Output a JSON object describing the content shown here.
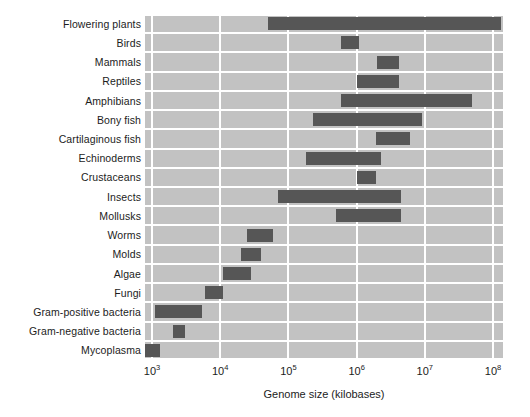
{
  "chart_data": {
    "type": "bar",
    "orientation": "horizontal",
    "subtype": "range-bar",
    "title": "",
    "xlabel": "Genome size (kilobases)",
    "ylabel": "",
    "xscale": "log",
    "xlim": [
      1000,
      200000000
    ],
    "grid": true,
    "legend": false,
    "plot_background": "#c2c2c2",
    "bar_color": "#565656",
    "gridline_color": "#ffffff",
    "xticks": [
      1000,
      10000,
      100000,
      1000000,
      10000000,
      100000000
    ],
    "xticklabels": [
      "10³",
      "10⁴",
      "10⁵",
      "10⁶",
      "10⁷",
      "10⁸"
    ],
    "xtick_mantissas": [
      "10",
      "10",
      "10",
      "10",
      "10",
      "10"
    ],
    "xtick_exponents": [
      "3",
      "4",
      "5",
      "6",
      "7",
      "8"
    ],
    "categories": [
      "Flowering plants",
      "Birds",
      "Mammals",
      "Reptiles",
      "Amphibians",
      "Bony fish",
      "Cartilaginous fish",
      "Echinoderms",
      "Crustaceans",
      "Insects",
      "Mollusks",
      "Worms",
      "Molds",
      "Algae",
      "Fungi",
      "Gram-positive bacteria",
      "Gram-negative bacteria",
      "Mycoplasma"
    ],
    "ranges": [
      {
        "category": "Flowering plants",
        "low": 50000,
        "high": 130000000
      },
      {
        "category": "Birds",
        "low": 600000,
        "high": 1100000
      },
      {
        "category": "Mammals",
        "low": 2000000,
        "high": 4200000
      },
      {
        "category": "Reptiles",
        "low": 1000000,
        "high": 4200000
      },
      {
        "category": "Amphibians",
        "low": 600000,
        "high": 50000000
      },
      {
        "category": "Bony fish",
        "low": 230000,
        "high": 9000000
      },
      {
        "category": "Cartilaginous fish",
        "low": 1900000,
        "high": 6000000
      },
      {
        "category": "Echinoderms",
        "low": 180000,
        "high": 2300000
      },
      {
        "category": "Crustaceans",
        "low": 1000000,
        "high": 1900000
      },
      {
        "category": "Insects",
        "low": 70000,
        "high": 4500000
      },
      {
        "category": "Mollusks",
        "low": 500000,
        "high": 4500000
      },
      {
        "category": "Worms",
        "low": 25000,
        "high": 60000
      },
      {
        "category": "Molds",
        "low": 20000,
        "high": 40000
      },
      {
        "category": "Algae",
        "low": 11000,
        "high": 28000
      },
      {
        "category": "Fungi",
        "low": 6000,
        "high": 11000
      },
      {
        "category": "Gram-positive bacteria",
        "low": 1100,
        "high": 5500
      },
      {
        "category": "Gram-negative bacteria",
        "low": 2000,
        "high": 3000
      },
      {
        "category": "Mycoplasma",
        "low": 800,
        "high": 1300
      }
    ]
  },
  "axis": {
    "x_title": "Genome size (kilobases)"
  }
}
